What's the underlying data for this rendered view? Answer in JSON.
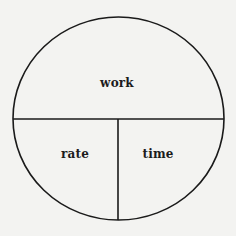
{
  "diagram": {
    "type": "work-rate-time circle",
    "sections": [
      {
        "id": "top",
        "label": "work"
      },
      {
        "id": "bottom-left",
        "label": "rate"
      },
      {
        "id": "bottom-right",
        "label": "time"
      }
    ]
  },
  "colors": {
    "background": "#f3f3f1",
    "stroke": "#1a1a1a",
    "text": "#1c1c1c"
  }
}
